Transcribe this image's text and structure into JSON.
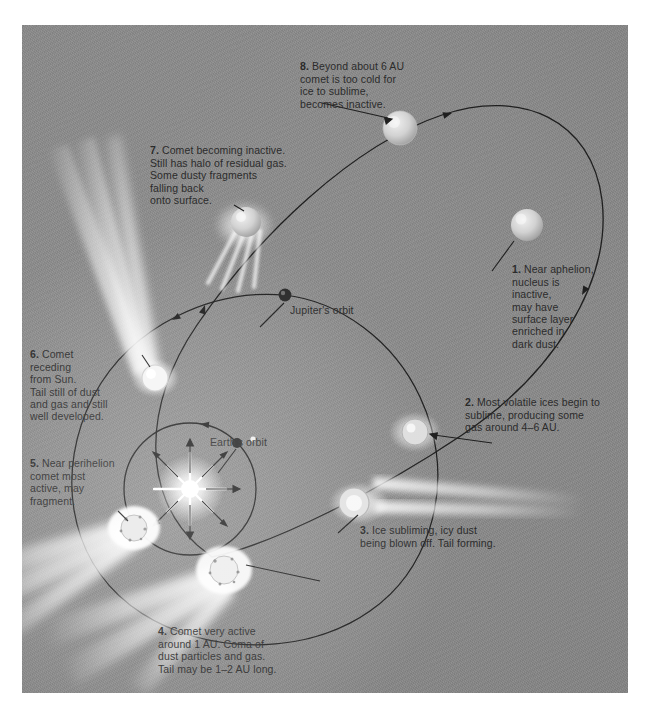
{
  "figure": {
    "background_color": "#8a8a8a",
    "text_color": "#2b2b2b"
  },
  "orbit_labels": [
    {
      "name": "jupiters-orbit",
      "text": "Jupiter's orbit"
    },
    {
      "name": "earths-orbit",
      "text": "Earth's orbit"
    }
  ],
  "steps": [
    {
      "number": "1.",
      "text": "Near aphelion,\nnucleus is\ninactive,\nmay have\nsurface layer\nenriched in\ndark dust."
    },
    {
      "number": "2.",
      "text": "Most volatile ices begin to\nsublime, producing some\ngas around 4–6 AU."
    },
    {
      "number": "3.",
      "text": "Ice subliming, icy dust\nbeing blown off. Tail forming."
    },
    {
      "number": "4.",
      "text": "Comet very active\naround 1 AU. Coma of\ndust particles and gas.\nTail may be 1–2 AU long."
    },
    {
      "number": "5.",
      "text": "Near perihelion\ncomet most\nactive, may\nfragment."
    },
    {
      "number": "6.",
      "text": "Comet\nreceding\nfrom Sun.\nTail still of dust\nand gas and still\nwell developed."
    },
    {
      "number": "7.",
      "text": "Comet becoming inactive.\nStill has halo of residual gas.\nSome dusty fragments\nfalling back\nonto surface."
    },
    {
      "number": "8.",
      "text": "Beyond about 6 AU\ncomet is too cold for\nice to sublime,\nbecomes inactive."
    }
  ],
  "objects": [
    {
      "name": "sun",
      "kind": "star",
      "label": ""
    },
    {
      "name": "jupiter",
      "kind": "planet",
      "label": ""
    },
    {
      "name": "earth",
      "kind": "planet",
      "label": ""
    },
    {
      "name": "comet-aphelion",
      "kind": "comet-inactive",
      "step": "8"
    },
    {
      "name": "comet-step7",
      "kind": "comet-halo",
      "step": "7"
    },
    {
      "name": "comet-step6",
      "kind": "comet-tailed",
      "step": "6"
    },
    {
      "name": "comet-step5",
      "kind": "comet-bright",
      "step": "5"
    },
    {
      "name": "comet-step4",
      "kind": "comet-bright",
      "step": "4"
    },
    {
      "name": "comet-step3",
      "kind": "comet-tailed",
      "step": "3"
    },
    {
      "name": "comet-step2",
      "kind": "comet-faint",
      "step": "2"
    }
  ]
}
